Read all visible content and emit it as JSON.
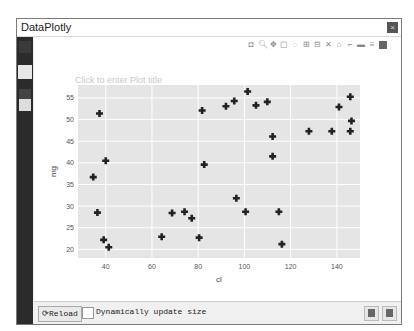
{
  "window": {
    "title": "DataPlotly",
    "close_label": "×"
  },
  "sidebar": {
    "items": [
      {
        "name": "plot-settings"
      },
      {
        "name": "plot-canvas"
      },
      {
        "name": "layers"
      },
      {
        "name": "export"
      }
    ]
  },
  "plot": {
    "title_placeholder": "Click to enter Plot title",
    "modebar": [
      "camera-icon",
      "zoom-icon",
      "pan-icon",
      "box-select-icon",
      "lasso-icon",
      "zoom-in-icon",
      "zoom-out-icon",
      "autoscale-icon",
      "reset-axes-icon",
      "spike-lines-icon",
      "hover-closest-icon",
      "hover-compare-icon",
      "plotly-logo-icon"
    ]
  },
  "chart_data": {
    "type": "scatter",
    "title": "",
    "xlabel": "cl",
    "ylabel": "mg",
    "xlim": [
      28,
      150
    ],
    "ylim": [
      18,
      58
    ],
    "xticks": [
      40,
      60,
      80,
      100,
      120,
      140
    ],
    "yticks": [
      20,
      25,
      30,
      35,
      40,
      45,
      50,
      55
    ],
    "grid": true,
    "marker": "cross",
    "marker_color": "#222222",
    "plot_bg": "#e5e5e5",
    "points": [
      [
        37.3,
        51.4
      ],
      [
        40.0,
        40.5
      ],
      [
        34.6,
        36.7
      ],
      [
        36.4,
        28.5
      ],
      [
        39.1,
        22.2
      ],
      [
        41.3,
        20.5
      ],
      [
        64.2,
        22.9
      ],
      [
        68.7,
        28.4
      ],
      [
        74.1,
        28.7
      ],
      [
        77.2,
        27.2
      ],
      [
        80.4,
        22.7
      ],
      [
        81.7,
        52.1
      ],
      [
        82.6,
        39.6
      ],
      [
        92.0,
        53.1
      ],
      [
        95.6,
        54.3
      ],
      [
        96.5,
        31.8
      ],
      [
        100.5,
        28.7
      ],
      [
        101.4,
        56.5
      ],
      [
        105.0,
        53.3
      ],
      [
        109.9,
        54.1
      ],
      [
        112.2,
        46.1
      ],
      [
        112.2,
        41.5
      ],
      [
        114.9,
        28.7
      ],
      [
        116.2,
        21.2
      ],
      [
        127.9,
        47.3
      ],
      [
        137.8,
        47.3
      ],
      [
        140.9,
        52.9
      ],
      [
        145.8,
        47.3
      ],
      [
        146.3,
        49.7
      ],
      [
        145.8,
        55.3
      ]
    ]
  },
  "bottombar": {
    "reload_label": "Reload",
    "dynamic_update_label": "Dynamically update size",
    "dynamic_update_checked": false
  }
}
